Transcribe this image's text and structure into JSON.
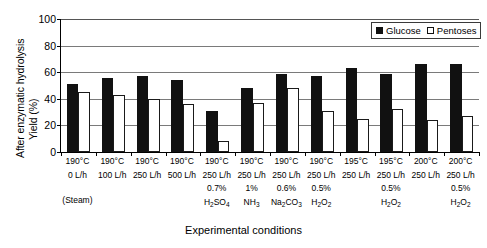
{
  "chart_data": {
    "type": "bar",
    "title": "",
    "xlabel": "Experimental conditions",
    "ylabel": "After enzymatic hydrolysis",
    "ylabel_line2": "Yield (%)",
    "ylim": [
      0,
      100
    ],
    "yticks": [
      100,
      80,
      60,
      40,
      20,
      0
    ],
    "grid": true,
    "legend_position": "top-right",
    "categories": [
      "190°C 0 L/h (Steam)",
      "190°C 100 L/h",
      "190°C 250 L/h",
      "190°C 500 L/h",
      "190°C 250 L/h 0.7% H2SO4",
      "190°C 250 L/h 1% NH3",
      "190°C 250 L/h 0.6% Na2CO3",
      "190°C 250 L/h 0.5% H2O2",
      "195°C 250 L/h",
      "195°C 250 L/h 0.5% H2O2",
      "200°C 250 L/h",
      "200°C 250 L/h 0.5% H2O2"
    ],
    "series": [
      {
        "name": "Glucose",
        "values": [
          51,
          56,
          57,
          54,
          31,
          48,
          59,
          57,
          63,
          59,
          66,
          66
        ]
      },
      {
        "name": "Pentoses",
        "values": [
          45,
          43,
          40,
          36,
          8,
          37,
          48,
          31,
          25,
          32,
          24,
          27
        ]
      }
    ]
  },
  "legend": {
    "items": [
      {
        "label": "Glucose",
        "swatch": "filled-square-icon"
      },
      {
        "label": "Pentoses",
        "swatch": "hollow-square-icon"
      }
    ]
  },
  "axes": {
    "y_title_outer": "After enzymatic hydrolysis",
    "y_title_inner": "Yield (%)",
    "y_ticks": [
      "100",
      "80",
      "60",
      "40",
      "20",
      "0"
    ],
    "x_title": "Experimental conditions"
  },
  "x_axis_rows": {
    "temperature": [
      "190°C",
      "190°C",
      "190°C",
      "190°C",
      "190°C",
      "190°C",
      "190°C",
      "190°C",
      "195°C",
      "195°C",
      "200°C",
      "200°C"
    ],
    "flow": [
      "0 L/h",
      "100 L/h",
      "250 L/h",
      "500 L/h",
      "250 L/h",
      "250 L/h",
      "250 L/h",
      "250 L/h",
      "250 L/h",
      "250 L/h",
      "250 L/h",
      "250 L/h"
    ],
    "concentration": [
      "",
      "",
      "",
      "",
      "0.7%",
      "1%",
      "0.6%",
      "0.5%",
      "",
      "0.5%",
      "",
      "0.5%"
    ],
    "chemical_html": [
      "",
      "",
      "",
      "",
      "H<sub>2</sub>SO<sub>4</sub>",
      "NH<sub>3</sub>",
      "Na<sub>2</sub>CO<sub>3</sub>",
      "H<sub>2</sub>O<sub>2</sub>",
      "",
      "H<sub>2</sub>O<sub>2</sub>",
      "",
      "H<sub>2</sub>O<sub>2</sub>"
    ],
    "note": "(Steam)",
    "note_group_index": 0
  },
  "colors": {
    "glucose": "#111111",
    "pentoses": "#ffffff",
    "pentoses_border": "#1a1a1a",
    "gridline": "#7a7a7a",
    "axis": "#000000",
    "background": "#ffffff"
  }
}
